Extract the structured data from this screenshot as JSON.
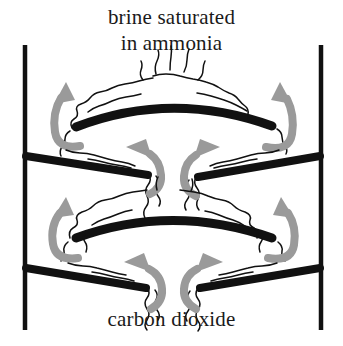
{
  "figure": {
    "type": "process-diagram",
    "background_color": "#ffffff"
  },
  "labels": {
    "top": "brine saturated\nin ammonia",
    "bottom": "carbon dioxide",
    "top_line_1": "brine saturated",
    "top_line_2": "in ammonia"
  },
  "colors": {
    "structure": "#111111",
    "arrow": "#9a9a9a",
    "flow_line": "#111111",
    "text": "#1a1a1a",
    "background": "#ffffff"
  },
  "elements": {
    "left_wall": "vertical-tower-wall-left",
    "right_wall": "vertical-tower-wall-right",
    "arched_plate_upper": "dome-baffle-plate-upper",
    "arched_plate_lower": "dome-baffle-plate-lower",
    "flat_plate_upper_left": "sloped-plate-upper-left",
    "flat_plate_upper_right": "sloped-plate-upper-right",
    "flat_plate_lower_left": "sloped-plate-lower-left",
    "flat_plate_lower_right": "sloped-plate-lower-right"
  },
  "arrows": {
    "count": 8,
    "direction": "upward",
    "meaning": "carbon-dioxide-gas-rising",
    "positions": [
      "outer-upper-left",
      "outer-upper-right",
      "inner-middle-left",
      "inner-middle-right",
      "outer-lower-left",
      "outer-lower-right",
      "inner-bottom-left",
      "inner-bottom-right"
    ]
  },
  "flow_lines": {
    "meaning": "brine-liquid-film-and-gas-turbulence",
    "style": "wavy"
  }
}
